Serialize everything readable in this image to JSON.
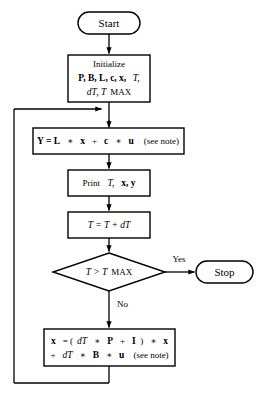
{
  "diagram": {
    "colors": {
      "stroke": "#000000",
      "fill": "#ffffff",
      "text": "#000000"
    },
    "nodes": {
      "start": {
        "shape": "terminator",
        "label": "Start"
      },
      "initialize": {
        "shape": "process",
        "line1": "Initialize",
        "line2_bold": "P, B, L, c, x,",
        "line2_ital": "T,",
        "line3_ital": "dT, T",
        "line3_roman": "MAX"
      },
      "output_eq": {
        "shape": "process",
        "bold1": "Y = L",
        "op1": "∗",
        "bold2": "x",
        "plus1": "+",
        "bold3": "c",
        "op2": "∗",
        "bold4": "u",
        "note": "(see note)"
      },
      "print": {
        "shape": "process",
        "word": "Print",
        "ital": "T,",
        "bold": "x, y"
      },
      "advance_time": {
        "shape": "process",
        "label": "T = T + dT"
      },
      "decision": {
        "shape": "decision",
        "ital_left": "T > T",
        "roman_right": "MAX"
      },
      "stop": {
        "shape": "terminator",
        "label": "Stop"
      },
      "state_update": {
        "shape": "process",
        "l1_b1": "x",
        "l1_eq": "= (",
        "l1_i1": "dT",
        "l1_op1": "∗",
        "l1_b2": "P",
        "l1_plus": "+",
        "l1_b3": "I",
        "l1_close": ")",
        "l1_op2": "∗",
        "l1_b4": "x",
        "l2_plus": "+",
        "l2_i1": "dT",
        "l2_op1": "∗",
        "l2_b1": "B",
        "l2_op2": "∗",
        "l2_b2": "u",
        "l2_note": "(see note)"
      }
    },
    "edges": {
      "yes_label": "Yes",
      "no_label": "No"
    }
  }
}
